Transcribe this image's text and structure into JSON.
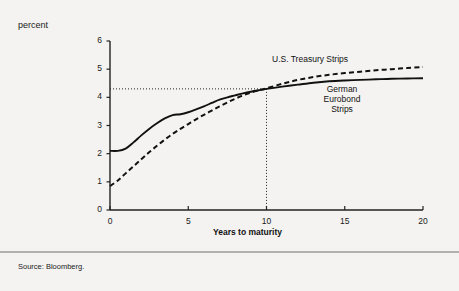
{
  "figure": {
    "percent_label": "percent",
    "source_note": "Source: Bloomberg.",
    "background_color": "#f4f3f1",
    "ink_color": "#111111"
  },
  "chart_data": {
    "type": "line",
    "title": "",
    "subtitle": "",
    "xlabel": "Years to maturity",
    "ylabel": "percent",
    "xlim": [
      0,
      20
    ],
    "ylim": [
      0,
      6
    ],
    "xticks": [
      0,
      5,
      10,
      15,
      20
    ],
    "xtick_labels": [
      "0",
      "5",
      "10",
      "15",
      "20"
    ],
    "yticks": [
      0,
      1,
      2,
      3,
      4,
      5,
      6
    ],
    "ytick_labels": [
      "0",
      "1",
      "2",
      "3",
      "4",
      "5",
      "6"
    ],
    "grid": false,
    "legend_position": "inline-annotations",
    "annotations": [
      {
        "text": "U.S. Treasury Strips",
        "x": 11.5,
        "y": 5.4,
        "series": "U.S. Treasury Strips"
      },
      {
        "text": "German",
        "x": 15.0,
        "y": 4.1,
        "series": "German Eurobond Strips"
      },
      {
        "text": "Eurobond",
        "x": 15.0,
        "y": 3.75,
        "series": "German Eurobond Strips"
      },
      {
        "text": "Strips",
        "x": 15.0,
        "y": 3.4,
        "series": "German Eurobond Strips"
      }
    ],
    "reference_lines": [
      {
        "type": "vertical",
        "value": 10,
        "style": "dotted",
        "label": "10"
      },
      {
        "type": "horizontal",
        "value": 4.3,
        "style": "dotted",
        "label": "4.3"
      }
    ],
    "crossover_point": {
      "x": 10,
      "y": 4.3
    },
    "x": [
      0,
      0.5,
      1,
      1.5,
      2,
      2.5,
      3,
      3.5,
      4,
      4.5,
      5,
      5.5,
      6,
      6.5,
      7,
      7.5,
      8,
      8.5,
      9,
      9.5,
      10,
      11,
      12,
      13,
      14,
      15,
      16,
      17,
      18,
      19,
      20
    ],
    "series": [
      {
        "name": "German Eurobond Strips",
        "style": "solid",
        "color": "#111111",
        "values": [
          2.1,
          2.1,
          2.18,
          2.4,
          2.65,
          2.88,
          3.08,
          3.25,
          3.37,
          3.4,
          3.47,
          3.57,
          3.68,
          3.8,
          3.92,
          4.0,
          4.07,
          4.14,
          4.2,
          4.25,
          4.3,
          4.38,
          4.45,
          4.52,
          4.57,
          4.6,
          4.62,
          4.64,
          4.66,
          4.67,
          4.68
        ]
      },
      {
        "name": "U.S. Treasury Strips",
        "style": "dashed",
        "color": "#111111",
        "values": [
          0.85,
          1.05,
          1.3,
          1.55,
          1.8,
          2.05,
          2.28,
          2.5,
          2.7,
          2.88,
          3.05,
          3.22,
          3.38,
          3.53,
          3.68,
          3.82,
          3.95,
          4.07,
          4.17,
          4.25,
          4.32,
          4.48,
          4.62,
          4.72,
          4.8,
          4.86,
          4.91,
          4.96,
          5.0,
          5.04,
          5.08
        ]
      }
    ]
  }
}
